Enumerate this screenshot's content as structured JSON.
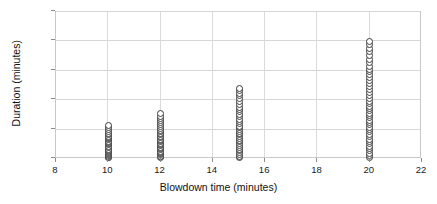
{
  "chart_data": {
    "type": "scatter",
    "title": "",
    "subtitle": "",
    "xlabel": "Blowdown time (minutes)",
    "ylabel": "Duration (minutes)",
    "xlim": [
      8,
      22
    ],
    "ylim": [
      0,
      250
    ],
    "xticks": [
      8,
      10,
      12,
      14,
      16,
      18,
      20,
      22
    ],
    "xtick_labels": [
      "8",
      "10",
      "12",
      "14",
      "16",
      "18",
      "20",
      "22"
    ],
    "yticks": [
      0,
      50,
      100,
      150,
      200,
      250
    ],
    "ytick_labels": [
      "0",
      "50",
      "100",
      "150",
      "200",
      "250"
    ],
    "grid": "horizontal-and-vertical",
    "legend": "none",
    "marker_style": "open-circle",
    "marker_edge_color": "#3a3a3a",
    "marker_face_color": "#ffffff",
    "frame_color": "#c9c9c9",
    "gridline_color": "#d6d6d6",
    "groups": [
      {
        "x": 10,
        "count": 26,
        "y_min": 2,
        "y_max": 57,
        "y": [
          2,
          3,
          4,
          6,
          7,
          9,
          11,
          13,
          15,
          17,
          19,
          21,
          24,
          26,
          28,
          30,
          33,
          35,
          37,
          39,
          42,
          44,
          47,
          50,
          53,
          57
        ]
      },
      {
        "x": 12,
        "count": 30,
        "y_min": 2,
        "y_max": 78,
        "y": [
          2,
          4,
          5,
          7,
          9,
          11,
          13,
          16,
          18,
          20,
          23,
          25,
          27,
          30,
          32,
          34,
          37,
          39,
          41,
          44,
          46,
          49,
          52,
          55,
          58,
          62,
          65,
          69,
          73,
          78
        ]
      },
      {
        "x": 15,
        "count": 34,
        "y_min": 2,
        "y_max": 120,
        "y": [
          2,
          5,
          8,
          11,
          14,
          17,
          20,
          23,
          26,
          29,
          32,
          35,
          38,
          41,
          44,
          47,
          50,
          53,
          56,
          60,
          64,
          68,
          72,
          76,
          80,
          84,
          88,
          93,
          98,
          103,
          108,
          112,
          116,
          120
        ]
      },
      {
        "x": 20,
        "count": 44,
        "y_min": 2,
        "y_max": 200,
        "y": [
          2,
          6,
          10,
          14,
          18,
          22,
          26,
          30,
          34,
          38,
          42,
          46,
          50,
          54,
          58,
          62,
          66,
          70,
          74,
          78,
          82,
          86,
          90,
          94,
          98,
          103,
          108,
          113,
          118,
          123,
          128,
          133,
          138,
          143,
          148,
          153,
          158,
          164,
          170,
          176,
          182,
          188,
          194,
          200
        ]
      }
    ]
  }
}
